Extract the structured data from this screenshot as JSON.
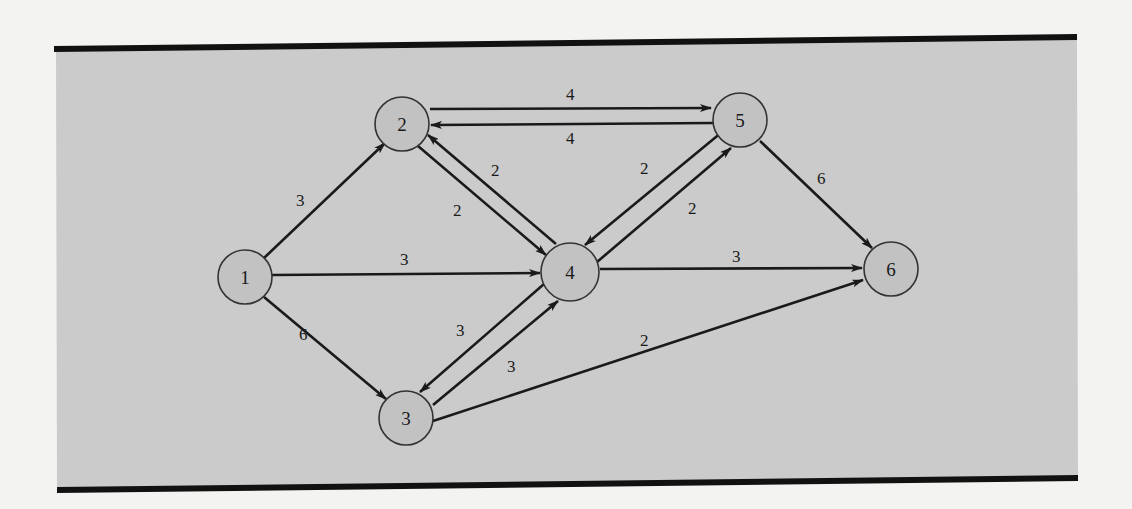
{
  "figure": {
    "type": "directed network diagram",
    "colors": {
      "page_background": "#f3f3f1",
      "panel_background": "#cbcbcb",
      "rule": "#111111",
      "node_fill": "#c2c2c2",
      "node_stroke": "#333333",
      "edge": "#1a1a1a"
    }
  },
  "nodes": [
    {
      "id": "1",
      "label": "1",
      "x": 245,
      "y": 277,
      "r": 27
    },
    {
      "id": "2",
      "label": "2",
      "x": 402,
      "y": 124,
      "r": 27
    },
    {
      "id": "3",
      "label": "3",
      "x": 406,
      "y": 418,
      "r": 27
    },
    {
      "id": "4",
      "label": "4",
      "x": 570,
      "y": 272,
      "r": 29
    },
    {
      "id": "5",
      "label": "5",
      "x": 740,
      "y": 120,
      "r": 27
    },
    {
      "id": "6",
      "label": "6",
      "x": 891,
      "y": 269,
      "r": 27
    }
  ],
  "edges": [
    {
      "from": "1",
      "to": "2",
      "weight": "3",
      "label_x": 301,
      "label_y": 205
    },
    {
      "from": "1",
      "to": "4",
      "weight": "3",
      "label_x": 405,
      "label_y": 265
    },
    {
      "from": "1",
      "to": "3",
      "weight": "6",
      "label_x": 330,
      "label_y": 340
    },
    {
      "from": "2",
      "to": "5",
      "weight": "4",
      "label_x": 571,
      "label_y": 100
    },
    {
      "from": "5",
      "to": "2",
      "weight": "4",
      "label_x": 571,
      "label_y": 144
    },
    {
      "from": "2",
      "to": "4",
      "weight": "2",
      "label_x": 458,
      "label_y": 216
    },
    {
      "from": "4",
      "to": "2",
      "weight": "2",
      "label_x": 496,
      "label_y": 176
    },
    {
      "from": "5",
      "to": "4",
      "weight": "2",
      "label_x": 646,
      "label_y": 170
    },
    {
      "from": "4",
      "to": "5",
      "weight": "2",
      "label_x": 693,
      "label_y": 214
    },
    {
      "from": "5",
      "to": "6",
      "weight": "6",
      "label_x": 823,
      "label_y": 184
    },
    {
      "from": "4",
      "to": "6",
      "weight": "3",
      "label_x": 737,
      "label_y": 262
    },
    {
      "from": "4",
      "to": "3",
      "weight": "3",
      "label_x": 461,
      "label_y": 336
    },
    {
      "from": "3",
      "to": "4",
      "weight": "3",
      "label_x": 512,
      "label_y": 372
    },
    {
      "from": "3",
      "to": "6",
      "weight": "2",
      "label_x": 644,
      "label_y": 346
    }
  ],
  "edge_labels": {
    "e12": "3",
    "e14": "3",
    "e13": "6",
    "e25": "4",
    "e52": "4",
    "e24": "2",
    "e42": "2",
    "e54": "2",
    "e45": "2",
    "e56": "6",
    "e46": "3",
    "e43": "3",
    "e34": "3",
    "e36": "2"
  },
  "node_labels": {
    "n1": "1",
    "n2": "2",
    "n3": "3",
    "n4": "4",
    "n5": "5",
    "n6": "6"
  }
}
